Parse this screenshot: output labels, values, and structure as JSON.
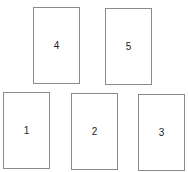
{
  "boxes": [
    {
      "label": "4",
      "x": 33,
      "y": 7,
      "w": 47,
      "h": 77
    },
    {
      "label": "5",
      "x": 105,
      "y": 8,
      "w": 47,
      "h": 77
    },
    {
      "label": "1",
      "x": 3,
      "y": 92,
      "w": 47,
      "h": 77
    },
    {
      "label": "2",
      "x": 71,
      "y": 93,
      "w": 47,
      "h": 77
    },
    {
      "label": "3",
      "x": 138,
      "y": 94,
      "w": 47,
      "h": 77
    }
  ]
}
